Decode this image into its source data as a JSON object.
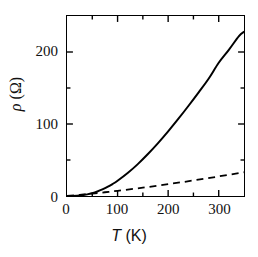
{
  "figure": {
    "background_color": "#ffffff",
    "frame_color": "#000000"
  },
  "axes": {
    "x": {
      "title_symbol": "T",
      "title_unit": " (K)",
      "title_full": "T (K)",
      "major_ticks": [
        0,
        100,
        200,
        300
      ],
      "major_tick_labels": [
        "0",
        "100",
        "200",
        "300"
      ],
      "minor_ticks": [
        50,
        150,
        250,
        350
      ],
      "range": [
        0,
        350
      ]
    },
    "y": {
      "title_symbol": "ρ",
      "title_unit": " (Ω)",
      "title_full": "ρ (Ω)",
      "major_ticks": [
        0,
        100,
        200
      ],
      "major_tick_labels": [
        "0",
        "100",
        "200"
      ],
      "minor_ticks": [
        50,
        150,
        250
      ],
      "range": [
        0,
        250
      ]
    }
  },
  "chart_data": {
    "type": "line",
    "title": "",
    "xlabel": "T (K)",
    "ylabel": "ρ (Ω)",
    "xlim": [
      0,
      350
    ],
    "ylim": [
      0,
      250
    ],
    "grid": false,
    "legend": "none",
    "xticks": [
      0,
      100,
      200,
      300
    ],
    "yticks": [
      0,
      100,
      200
    ],
    "xminorticks": [
      50,
      150,
      250,
      350
    ],
    "yminorticks": [
      50,
      150,
      250
    ],
    "series": [
      {
        "name": "total resistivity",
        "style": "solid",
        "color": "#000000",
        "linewidth": 2.0,
        "x": [
          0,
          10,
          20,
          30,
          40,
          50,
          60,
          70,
          80,
          90,
          100,
          120,
          140,
          160,
          180,
          200,
          220,
          240,
          260,
          280,
          300,
          320,
          340,
          350
        ],
        "y": [
          0.0,
          0.1,
          0.4,
          1.1,
          2.3,
          4.0,
          6.3,
          9.2,
          12.6,
          16.6,
          21.2,
          31.9,
          44.3,
          58.3,
          73.5,
          89.8,
          107.0,
          125.0,
          143.6,
          162.8,
          185.0,
          203.0,
          222.0,
          228.0
        ]
      },
      {
        "name": "phonon-limited linear term",
        "style": "dashed",
        "color": "#000000",
        "linewidth": 1.8,
        "dash_pattern": "7,5",
        "x": [
          0,
          25,
          50,
          75,
          100,
          150,
          200,
          250,
          300,
          350
        ],
        "y": [
          0.0,
          1.6,
          3.4,
          5.2,
          7.2,
          11.6,
          16.4,
          21.6,
          27.2,
          33.0
        ]
      }
    ]
  }
}
